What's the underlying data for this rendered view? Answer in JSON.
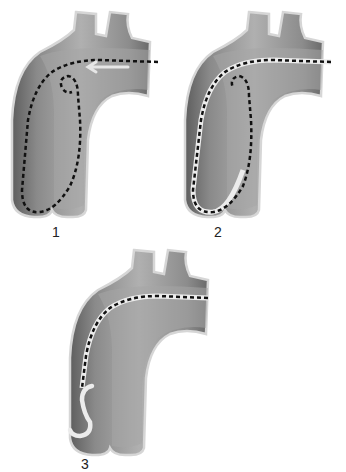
{
  "figure": {
    "colors": {
      "vessel_fill_light": "#a8a8a8",
      "vessel_fill_dark": "#6e6e6e",
      "vessel_rim": "#d8d8d8",
      "catheter_dash": "#111111",
      "guidewire": "#e8e8e8"
    },
    "panels": [
      {
        "id": 1,
        "label": "1",
        "content": "Dashed catheter looped in ascending aorta; white arrow pointing left along arch"
      },
      {
        "id": 2,
        "label": "2",
        "content": "Dashed catheter looped with white guidewire inside loop"
      },
      {
        "id": 3,
        "label": "3",
        "content": "Dashed catheter straightened along outer arch; J-tipped white guidewire in ascending aorta"
      }
    ]
  }
}
